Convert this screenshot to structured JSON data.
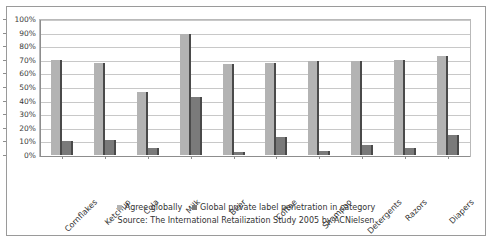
{
  "chart_data": {
    "type": "bar",
    "title": "",
    "xlabel": "",
    "ylabel": "",
    "ylim": [
      0,
      100
    ],
    "grid": true,
    "legend_position": "bottom",
    "categories": [
      "Cornflakes",
      "Ketchup",
      "Cola",
      "Milk",
      "Beer",
      "Coffee",
      "Shampoo",
      "Detergents",
      "Razors",
      "Diapers"
    ],
    "ytick_labels": [
      "100%",
      "90%",
      "80%",
      "70%",
      "60%",
      "50%",
      "40%",
      "30%",
      "20%",
      "10%",
      "0%"
    ],
    "ytick_values": [
      100,
      90,
      80,
      70,
      60,
      50,
      40,
      30,
      20,
      10,
      0
    ],
    "series": [
      {
        "name": "Agree globally",
        "color": "#b3b3b3",
        "values": [
          70,
          68,
          46,
          89,
          67,
          68,
          69,
          69,
          70,
          73
        ]
      },
      {
        "name": "Global private label penetration in category",
        "color": "#7a7a7a",
        "values": [
          10,
          11,
          5,
          43,
          2,
          13,
          3,
          7,
          5,
          15
        ]
      }
    ],
    "source_note": "Source: The International Retailization Study 2005 by ACNielsen"
  },
  "legend": {
    "items": [
      {
        "label": "Agree globally",
        "swatch": "legend-swatch-series1"
      },
      {
        "label": "Global private label penetration in category",
        "swatch": "legend-swatch-series2"
      }
    ]
  },
  "source": {
    "text": "Source: The International Retailization Study 2005 by ACNielsen"
  }
}
